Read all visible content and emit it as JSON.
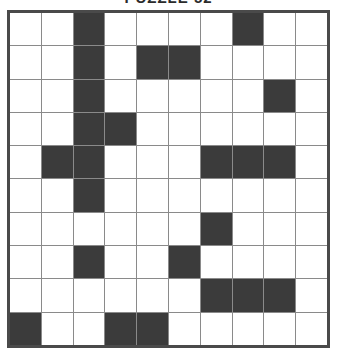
{
  "page": {
    "title": "PUZZLE 52",
    "background_color": "#ffffff"
  },
  "puzzle": {
    "type": "crossword-grid",
    "rows": 10,
    "cols": 10,
    "white_cell_color": "#ffffff",
    "black_cell_color": "#3b3b3b",
    "grid_line_color": "#8a8a8a",
    "border_color": "#4a4a4a",
    "legend": {
      "0": "white (fillable square)",
      "1": "black (blocked square)"
    },
    "grid": [
      [
        0,
        0,
        1,
        0,
        0,
        0,
        0,
        1,
        0,
        0
      ],
      [
        0,
        0,
        1,
        0,
        1,
        1,
        0,
        0,
        0,
        0
      ],
      [
        0,
        0,
        1,
        0,
        0,
        0,
        0,
        0,
        1,
        0
      ],
      [
        0,
        0,
        1,
        1,
        0,
        0,
        0,
        0,
        0,
        0
      ],
      [
        0,
        1,
        1,
        0,
        0,
        0,
        1,
        1,
        1,
        0
      ],
      [
        0,
        0,
        1,
        0,
        0,
        0,
        0,
        0,
        0,
        0
      ],
      [
        0,
        0,
        0,
        0,
        0,
        0,
        1,
        0,
        0,
        0
      ],
      [
        0,
        0,
        1,
        0,
        0,
        1,
        0,
        0,
        0,
        0
      ],
      [
        0,
        0,
        0,
        0,
        0,
        0,
        1,
        1,
        1,
        0
      ],
      [
        1,
        0,
        0,
        1,
        1,
        0,
        0,
        0,
        0,
        0
      ]
    ],
    "black_cell_count": 26,
    "white_cell_count": 74
  }
}
